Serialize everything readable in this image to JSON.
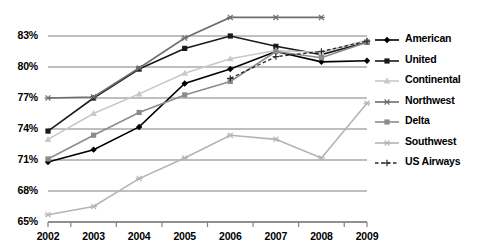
{
  "chart_data": {
    "type": "line",
    "title": "",
    "xlabel": "",
    "ylabel": "",
    "categories": [
      "2002",
      "2003",
      "2004",
      "2005",
      "2006",
      "2007",
      "2008",
      "2009"
    ],
    "x": [
      2002,
      2003,
      2004,
      2005,
      2006,
      2007,
      2008,
      2009
    ],
    "ylim": [
      65,
      84.5
    ],
    "ytick_labels": [
      "65%",
      "68%",
      "71%",
      "74%",
      "77%",
      "80%",
      "83%"
    ],
    "ytick_values": [
      65,
      68,
      71,
      74,
      77,
      80,
      83
    ],
    "grid": true,
    "legend_position": "right",
    "series": [
      {
        "name": "American",
        "color": "#000000",
        "marker": "diamond",
        "dash": "solid",
        "values": [
          70.8,
          72.0,
          74.2,
          78.4,
          79.8,
          81.5,
          80.5,
          80.6
        ]
      },
      {
        "name": "United",
        "color": "#1a1a1a",
        "marker": "square",
        "dash": "solid",
        "values": [
          73.8,
          77.0,
          79.8,
          81.8,
          83.0,
          82.0,
          81.2,
          82.4
        ]
      },
      {
        "name": "Continental",
        "color": "#c8c8c8",
        "marker": "triangle",
        "dash": "solid",
        "values": [
          73.0,
          75.5,
          77.4,
          79.4,
          80.8,
          81.6,
          81.4,
          82.6
        ]
      },
      {
        "name": "Northwest",
        "color": "#6e6e6e",
        "marker": "star",
        "dash": "solid",
        "values": [
          77.0,
          77.1,
          79.9,
          82.8,
          84.8,
          84.8,
          84.8,
          null
        ]
      },
      {
        "name": "Delta",
        "color": "#8c8c8c",
        "marker": "square",
        "dash": "solid",
        "values": [
          71.1,
          73.4,
          75.6,
          77.3,
          78.6,
          81.5,
          80.9,
          82.4
        ]
      },
      {
        "name": "Southwest",
        "color": "#b4b4b4",
        "marker": "star",
        "dash": "solid",
        "values": [
          65.7,
          66.5,
          69.2,
          71.2,
          73.4,
          73.0,
          71.2,
          76.5
        ]
      },
      {
        "name": "US Airways",
        "color": "#2b2b2b",
        "marker": "plus",
        "dash": "dashed",
        "values": [
          null,
          null,
          null,
          null,
          78.9,
          81.0,
          81.5,
          82.5
        ]
      }
    ]
  }
}
